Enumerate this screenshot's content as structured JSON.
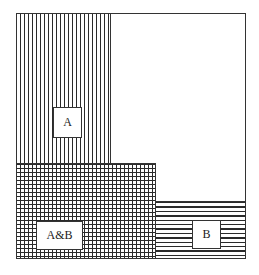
{
  "diagram": {
    "type": "set-overlap-area-diagram",
    "regions": [
      {
        "id": "A",
        "label": "A",
        "pattern": "vertical-lines"
      },
      {
        "id": "AB",
        "label": "A&B",
        "pattern": "crosshatch"
      },
      {
        "id": "B",
        "label": "B",
        "pattern": "horizontal-lines"
      }
    ],
    "labels": {
      "a": "A",
      "ab": "A&B",
      "b": "B"
    },
    "colors": {
      "line": "#2a2a2a",
      "background": "#ffffff",
      "border": "#333333"
    }
  }
}
